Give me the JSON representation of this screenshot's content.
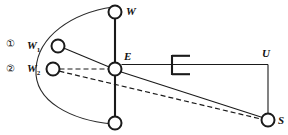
{
  "figure": {
    "background_color": "#ffffff",
    "line_color": "#1a1a1a",
    "arc_color": "#2a2a2a"
  },
  "markers": [
    {
      "id": "marker-1",
      "text": "①",
      "x": 6,
      "y": 39
    },
    {
      "id": "marker-2",
      "text": "②",
      "x": 6,
      "y": 64
    }
  ],
  "labels": {
    "w_top": "W",
    "w_one": "W",
    "w_one_sub": "1",
    "w_two": "W",
    "w_two_sub": "2",
    "e_node": "E",
    "u_node": "U",
    "s_node": "S"
  },
  "nodes": [
    {
      "name": "node-w",
      "label": "W",
      "cx": 115,
      "cy": 12,
      "r": 6.5
    },
    {
      "name": "node-w1",
      "label": "W1",
      "cx": 58,
      "cy": 46,
      "r": 6.5
    },
    {
      "name": "node-w2",
      "label": "W2",
      "cx": 53,
      "cy": 69,
      "r": 6.5
    },
    {
      "name": "node-e",
      "label": "E",
      "cx": 115,
      "cy": 69,
      "r": 6.5
    },
    {
      "name": "node-bottom",
      "label": "",
      "cx": 115,
      "cy": 123,
      "r": 6.5
    },
    {
      "name": "node-s",
      "label": "S",
      "cx": 268,
      "cy": 120,
      "r": 6.5
    }
  ],
  "edges": [
    {
      "name": "wire-w-to-e",
      "style": "solid-thick"
    },
    {
      "name": "wire-e-to-bottom",
      "style": "solid-thick"
    },
    {
      "name": "wire-w1-to-e",
      "style": "solid-thin"
    },
    {
      "name": "wire-w2-to-e",
      "style": "dashed"
    },
    {
      "name": "wire-e-to-s",
      "style": "solid-thin"
    },
    {
      "name": "wire-w2-to-s",
      "style": "dashed"
    },
    {
      "name": "wire-e-to-battery",
      "style": "solid-thin"
    },
    {
      "name": "wire-battery-to-u",
      "style": "solid-thin"
    },
    {
      "name": "wire-u-to-s",
      "style": "solid-thin"
    },
    {
      "name": "arc-w-to-bottom",
      "style": "arc"
    }
  ],
  "components": [
    {
      "name": "battery-symbol",
      "type": "battery",
      "x": 172,
      "y": 69
    }
  ]
}
